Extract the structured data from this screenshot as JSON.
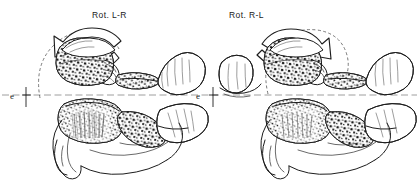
{
  "figure": {
    "background_color": "#ffffff",
    "ink_color": "#1d1d1d",
    "width": 419,
    "height": 189
  },
  "panels": [
    {
      "id": "left",
      "label": "Rot. L-R",
      "label_x": 92,
      "label_y": 18,
      "rotation_direction": "counterclockwise",
      "arrow_name": "rotation-arrow-left-to-right",
      "arc_name": "rotation-arc-dashed-left",
      "reference_marker": {
        "letter": "e",
        "letter_x": 12,
        "letter_y": 99,
        "tick_x": 26,
        "tick_top": 88,
        "tick_bottom": 108
      },
      "structures": [
        {
          "name": "atlas-c1-lateral-mass",
          "label": "atlas (C1) lateral mass"
        },
        {
          "name": "atlas-posterior-arch",
          "label": "atlas posterior arch"
        },
        {
          "name": "axis-c2-body",
          "label": "axis (C2) body"
        },
        {
          "name": "axis-spinous-process",
          "label": "axis spinous process"
        },
        {
          "name": "odontoid-process-dens",
          "label": "odontoid process (dens)"
        }
      ]
    },
    {
      "id": "right",
      "label": "Rot. R-L",
      "label_x": 229,
      "label_y": 18,
      "rotation_direction": "clockwise",
      "arrow_name": "rotation-arrow-right-to-left",
      "arc_name": "rotation-arc-dashed-right",
      "reference_marker": {
        "letter": "e",
        "letter_x": 198,
        "letter_y": 99,
        "tick_x": 213,
        "tick_top": 88,
        "tick_bottom": 108
      },
      "structures": [
        {
          "name": "atlas-c1-lateral-mass",
          "label": "atlas (C1) lateral mass"
        },
        {
          "name": "atlas-posterior-arch",
          "label": "atlas posterior arch"
        },
        {
          "name": "axis-c2-body",
          "label": "axis (C2) body"
        },
        {
          "name": "axis-spinous-process",
          "label": "axis spinous process"
        },
        {
          "name": "odontoid-process-dens",
          "label": "odontoid process (dens)"
        }
      ]
    }
  ],
  "datum_line": {
    "name": "horizontal-reference-line",
    "y": 95,
    "x_start": 0,
    "x_end": 419,
    "style": "dashed",
    "color": "#6b6b6b"
  }
}
